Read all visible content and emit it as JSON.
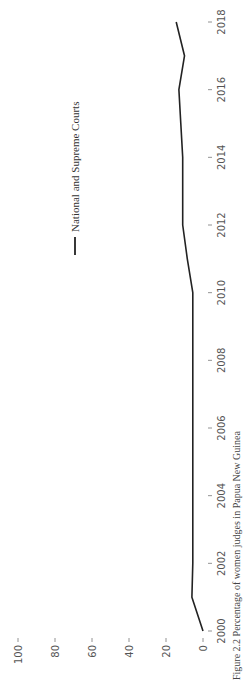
{
  "chart_data": {
    "type": "line",
    "title": "",
    "caption": "Figure 2.2  Percentage of women judges in Papua New Guinea",
    "xlabel": "",
    "ylabel": "",
    "x": [
      2000,
      2001,
      2002,
      2003,
      2004,
      2005,
      2006,
      2007,
      2008,
      2009,
      2010,
      2011,
      2012,
      2013,
      2014,
      2015,
      2016,
      2017,
      2018
    ],
    "x_ticks": [
      2000,
      2002,
      2004,
      2006,
      2008,
      2010,
      2012,
      2014,
      2016,
      2018
    ],
    "y_ticks": [
      0,
      20,
      40,
      60,
      80,
      100
    ],
    "ylim": [
      0,
      100
    ],
    "xlim": [
      2000,
      2018
    ],
    "grid": false,
    "legend_position": "upper right",
    "series": [
      {
        "name": "National and Supreme Courts",
        "color": "#222222",
        "values": [
          0,
          6,
          5.5,
          5.5,
          5.5,
          5.5,
          5.5,
          5.5,
          5.5,
          5.5,
          5.5,
          8.5,
          11,
          11,
          11,
          12,
          13,
          10,
          14.5
        ]
      }
    ],
    "rotation_deg": -90
  }
}
